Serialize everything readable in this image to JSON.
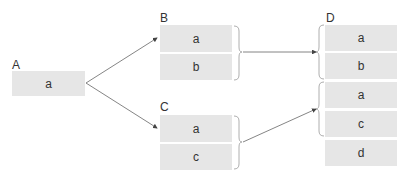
{
  "groups": {
    "A": {
      "label": "A",
      "items": [
        "a"
      ]
    },
    "B": {
      "label": "B",
      "items": [
        "a",
        "b"
      ]
    },
    "C": {
      "label": "C",
      "items": [
        "a",
        "c"
      ]
    },
    "D": {
      "label": "D",
      "items": [
        "a",
        "b",
        "a",
        "c",
        "d"
      ]
    }
  },
  "edges": [
    {
      "from": "A",
      "to": "B"
    },
    {
      "from": "A",
      "to": "C"
    },
    {
      "from": "B",
      "to": "D.group1"
    },
    {
      "from": "C",
      "to": "D.group2"
    }
  ],
  "colors": {
    "box": "#e6e6e6",
    "line": "#555555",
    "text": "#333333"
  }
}
